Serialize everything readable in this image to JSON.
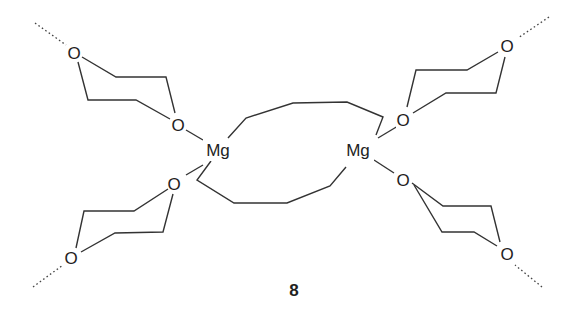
{
  "figure": {
    "compound_label": "8",
    "atoms": {
      "metal": "Mg",
      "oxygen": "O"
    },
    "metal_centers": [
      {
        "id": "mg-left",
        "label": "Mg"
      },
      {
        "id": "mg-right",
        "label": "Mg"
      }
    ],
    "dioxane_ligands": [
      {
        "id": "dioxane-top-left",
        "o_inner": "O",
        "o_outer": "O"
      },
      {
        "id": "dioxane-bottom-left",
        "o_inner": "O",
        "o_outer": "O"
      },
      {
        "id": "dioxane-top-right",
        "o_inner": "O",
        "o_outer": "O"
      },
      {
        "id": "dioxane-bottom-right",
        "o_inner": "O",
        "o_outer": "O"
      }
    ],
    "colors": {
      "bond": "#333333",
      "text": "#222222",
      "background": "#ffffff"
    }
  }
}
